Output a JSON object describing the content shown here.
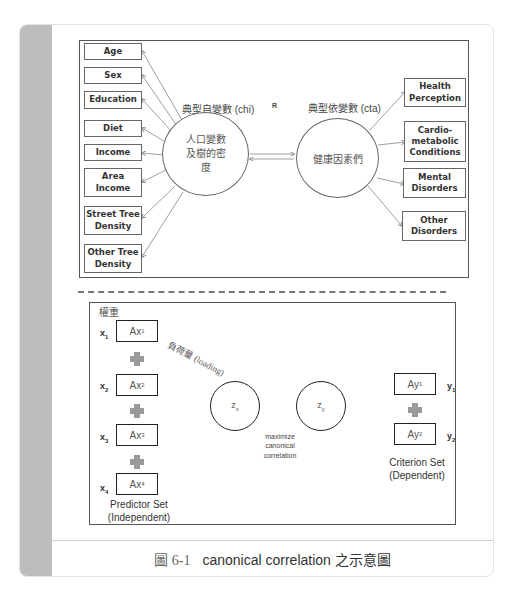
{
  "top_diagram": {
    "left_vars": [
      "Age",
      "Sex",
      "Education",
      "Diet",
      "Income",
      "Area Income",
      "Street Tree Density",
      "Other Tree Density"
    ],
    "right_vars": [
      "Health Perception",
      "Cardio-metabolic Conditions",
      "Mental Disorders",
      "Other Disorders"
    ],
    "left_circle_title": "典型自變數 (chi)",
    "left_circle_text": "人口變數及樹的密度",
    "right_circle_title": "典型依變數 (cta)",
    "right_circle_text": "健康因素們",
    "link_label": "R"
  },
  "bottom_diagram": {
    "weight_label": "權重",
    "loading_label": "負荷量 (loading)",
    "predictors": [
      {
        "var": "x",
        "sub": "1",
        "box": "Ax",
        "box_sub": "1"
      },
      {
        "var": "x",
        "sub": "2",
        "box": "Ax",
        "box_sub": "2"
      },
      {
        "var": "x",
        "sub": "3",
        "box": "Ax",
        "box_sub": "3"
      },
      {
        "var": "x",
        "sub": "4",
        "box": "Ax",
        "box_sub": "4"
      }
    ],
    "criteria": [
      {
        "var": "y",
        "sub": "1",
        "box": "Ay",
        "box_sub": "1"
      },
      {
        "var": "y",
        "sub": "2",
        "box": "Ay",
        "box_sub": "2"
      }
    ],
    "zx": "z",
    "zx_sub": "x",
    "zy": "z",
    "zy_sub": "y",
    "center_label_1": "maximize",
    "center_label_2": "canonical",
    "center_label_3": "correlation",
    "predictor_set_1": "Predictor Set",
    "predictor_set_2": "(Independent)",
    "criterion_set_1": "Criterion Set",
    "criterion_set_2": "(Dependent)"
  },
  "caption": {
    "figure_number": "圖 6-1",
    "text": "canonical correlation 之示意圖"
  }
}
